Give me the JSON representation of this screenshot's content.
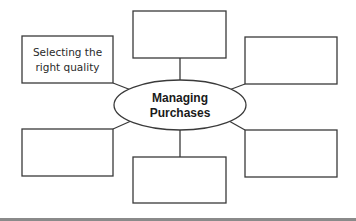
{
  "diagram": {
    "center": {
      "line1": "Managing",
      "line2": "Purchases"
    },
    "boxes": [
      {
        "position": "top",
        "line1": "",
        "line2": ""
      },
      {
        "position": "top-left",
        "line1": "Selecting the",
        "line2": "right quality"
      },
      {
        "position": "top-right",
        "line1": "",
        "line2": ""
      },
      {
        "position": "bottom-left",
        "line1": "",
        "line2": ""
      },
      {
        "position": "bottom-right",
        "line1": "",
        "line2": ""
      },
      {
        "position": "bottom",
        "line1": "",
        "line2": ""
      }
    ],
    "colors": {
      "stroke": "#3a3a3a",
      "text": "#1a1a1a",
      "footer_rule": "#8a8a8a"
    }
  }
}
